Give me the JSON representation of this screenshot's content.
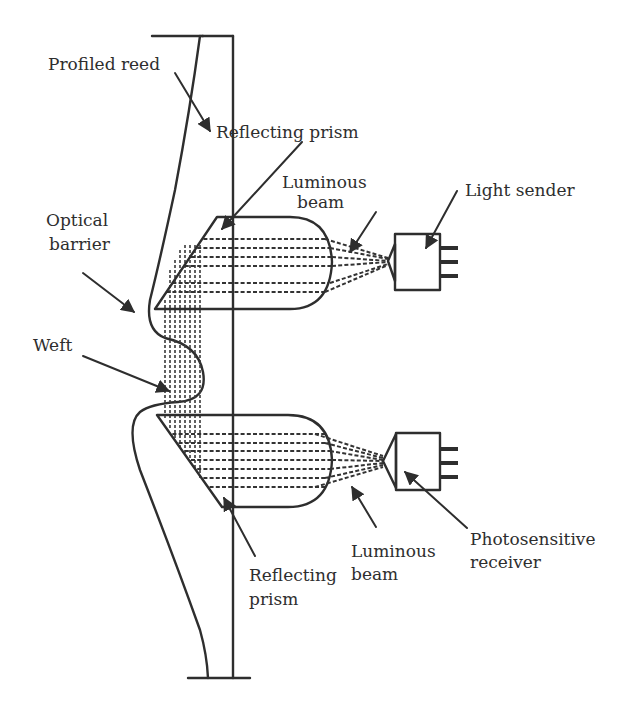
{
  "diagram": {
    "type": "optical weft detector (loom)",
    "colors": {
      "line": "#2e2e2e",
      "background": "#ffffff"
    },
    "labels": {
      "profiled_reed": "Profiled reed",
      "reflecting_prism_top": "Reflecting prism",
      "luminous_beam_top_line1": "Luminous",
      "luminous_beam_top_line2": "beam",
      "light_sender": "Light sender",
      "optical_barrier_line1": "Optical",
      "optical_barrier_line2": "barrier",
      "weft": "Weft",
      "reflecting_prism_bottom_line1": "Reflecting",
      "reflecting_prism_bottom_line2": "prism",
      "luminous_beam_bottom_line1": "Luminous",
      "luminous_beam_bottom_line2": "beam",
      "photosensitive_receiver_line1": "Photosensitive",
      "photosensitive_receiver_line2": "receiver"
    },
    "components": [
      {
        "id": "profiled-reed",
        "label_key": "profiled_reed"
      },
      {
        "id": "reflecting-prism-top",
        "label_key": "reflecting_prism_top"
      },
      {
        "id": "reflecting-prism-bottom",
        "label_key": "reflecting_prism_bottom_line1"
      },
      {
        "id": "light-sender",
        "label_key": "light_sender"
      },
      {
        "id": "photosensitive-receiver",
        "label_key": "photosensitive_receiver_line1"
      },
      {
        "id": "optical-barrier",
        "label_key": "optical_barrier_line1"
      },
      {
        "id": "weft",
        "label_key": "weft"
      }
    ]
  }
}
